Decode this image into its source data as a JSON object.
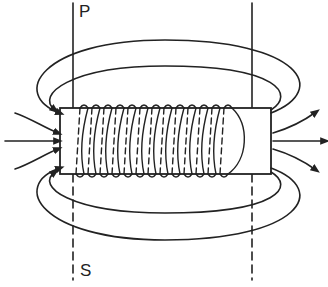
{
  "diagram": {
    "labels": {
      "top_plane": "P",
      "bottom_plane": "S"
    },
    "colors": {
      "line": "#222222",
      "background": "#ffffff"
    },
    "core": {
      "x": 60,
      "y": 108,
      "width": 211,
      "height": 66,
      "turns": 13
    }
  }
}
